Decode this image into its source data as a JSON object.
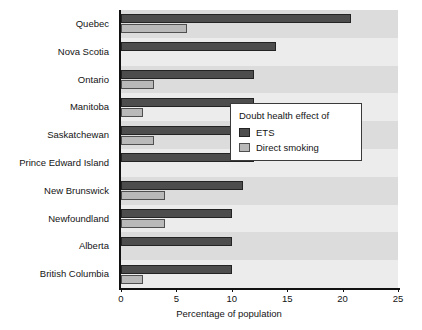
{
  "chart_data": {
    "type": "bar",
    "orientation": "horizontal",
    "title": "",
    "xlabel": "Percentage of population",
    "ylabel": "",
    "xlim": [
      0,
      25
    ],
    "xticks": [
      0,
      5,
      10,
      15,
      20,
      25
    ],
    "xtick_labels": [
      "0",
      "5",
      "10",
      "15",
      "20",
      "25"
    ],
    "grid": false,
    "legend_position": "center-right",
    "legend_title": "Doubt health effect of",
    "categories": [
      "Quebec",
      "Nova Scotia",
      "Ontario",
      "Manitoba",
      "Saskatchewan",
      "Prince Edward Island",
      "New Brunswick",
      "Newfoundland",
      "Alberta",
      "British Columbia"
    ],
    "series": [
      {
        "name": "ETS",
        "color": "#4d4d4d",
        "values": [
          20.8,
          14.0,
          12.0,
          12.0,
          12.0,
          12.0,
          11.0,
          10.0,
          10.0,
          10.0
        ]
      },
      {
        "name": "Direct smoking",
        "color": "#b9b9b9",
        "values": [
          6.0,
          0,
          3.0,
          2.0,
          3.0,
          0,
          4.0,
          4.0,
          0,
          2.0
        ]
      }
    ]
  },
  "legend": {
    "title": "Doubt health effect of",
    "entries": [
      {
        "label": "ETS",
        "color": "#4d4d4d"
      },
      {
        "label": "Direct smoking",
        "color": "#b9b9b9"
      }
    ]
  },
  "axis": {
    "x_title": "Percentage of population"
  },
  "colors": {
    "ets": "#4d4d4d",
    "direct_smoking": "#b9b9b9",
    "plot_background": "#e8e8e8",
    "band_dark": "#dcdcdc",
    "band_light": "#ececec",
    "axis": "#111111"
  }
}
